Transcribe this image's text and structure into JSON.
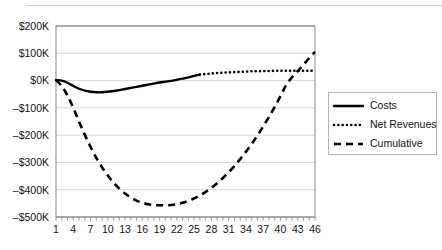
{
  "chart_data": {
    "type": "line",
    "title": "",
    "xlabel": "",
    "ylabel": "",
    "ylim": [
      -500000,
      200000
    ],
    "xlim": [
      1,
      46
    ],
    "grid": true,
    "grid_axis": "y",
    "legend_position": "right",
    "y_ticks": [
      200000,
      100000,
      0,
      -100000,
      -200000,
      -300000,
      -400000,
      -500000
    ],
    "y_tick_labels": [
      "$200K",
      "$100K",
      "$0K",
      "–$100K",
      "–$200K",
      "–$300K",
      "–$400K",
      "–$500K"
    ],
    "x_ticks": [
      1,
      4,
      7,
      10,
      13,
      16,
      19,
      22,
      25,
      28,
      31,
      34,
      37,
      40,
      43,
      46
    ],
    "x_tick_labels": [
      "1",
      "4",
      "7",
      "10",
      "13",
      "16",
      "19",
      "22",
      "25",
      "28",
      "31",
      "34",
      "37",
      "40",
      "43",
      "46"
    ],
    "x_minor_ticks": true,
    "series": [
      {
        "name": "Costs",
        "style": "solid",
        "color": "#000000",
        "x": [
          1,
          2,
          3,
          4,
          5,
          6,
          7,
          8,
          9,
          10,
          11,
          12,
          13,
          14,
          15,
          16,
          17,
          18,
          19,
          20,
          21,
          22,
          23,
          24,
          25,
          26
        ],
        "values": [
          2000,
          0,
          -8000,
          -20000,
          -30000,
          -37000,
          -41000,
          -43000,
          -43000,
          -41000,
          -38000,
          -35000,
          -31000,
          -27000,
          -23000,
          -19000,
          -15000,
          -11000,
          -7000,
          -4000,
          -1000,
          3000,
          7000,
          12000,
          17000,
          22000
        ]
      },
      {
        "name": "Net Revenues",
        "style": "dotted",
        "color": "#000000",
        "x": [
          26,
          27,
          28,
          29,
          30,
          31,
          32,
          33,
          34,
          35,
          36,
          37,
          38,
          39,
          40,
          41,
          42,
          43,
          44,
          45,
          46
        ],
        "values": [
          22000,
          24000,
          26000,
          28000,
          29000,
          30000,
          31000,
          32000,
          33000,
          34000,
          34000,
          35000,
          35000,
          36000,
          36000,
          36000,
          36000,
          36000,
          36000,
          36000,
          36000
        ]
      },
      {
        "name": "Cumulative",
        "style": "dashed",
        "color": "#000000",
        "x": [
          1,
          2,
          3,
          4,
          5,
          6,
          7,
          8,
          9,
          10,
          11,
          12,
          13,
          14,
          15,
          16,
          17,
          18,
          19,
          20,
          21,
          22,
          23,
          24,
          25,
          26,
          27,
          28,
          29,
          30,
          31,
          32,
          33,
          34,
          35,
          36,
          37,
          38,
          39,
          40,
          41,
          42,
          43,
          44,
          45,
          46
        ],
        "values": [
          2000,
          -20000,
          -55000,
          -100000,
          -150000,
          -198000,
          -243000,
          -283000,
          -318000,
          -348000,
          -374000,
          -396000,
          -414000,
          -429000,
          -440000,
          -448000,
          -453000,
          -456000,
          -457000,
          -457000,
          -456000,
          -453000,
          -448000,
          -441000,
          -432000,
          -421000,
          -408000,
          -393000,
          -376000,
          -357000,
          -336000,
          -313000,
          -288000,
          -261000,
          -232000,
          -201000,
          -168000,
          -133000,
          -96000,
          -57000,
          -16000,
          12000,
          35000,
          58000,
          82000,
          105000
        ]
      }
    ],
    "legend": [
      {
        "label": "Costs",
        "style": "solid"
      },
      {
        "label": "Net Revenues",
        "style": "dotted"
      },
      {
        "label": "Cumulative",
        "style": "dashed"
      }
    ]
  },
  "colors": {
    "line": "#000000",
    "grid": "#d7d7d7",
    "axis": "#8a8a8a",
    "rule": "#c9c9c9",
    "background": "#ffffff"
  }
}
